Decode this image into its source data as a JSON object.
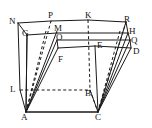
{
  "figure": {
    "type": "geometry-diagram",
    "width": 152,
    "height": 128,
    "background_color": "#ffffff",
    "stroke_color": "#1a1a1a",
    "label_color": "#111111"
  },
  "vertices": [
    {
      "id": "N",
      "label": "N",
      "x": 9,
      "y": 17,
      "point_x": 18,
      "point_y": 23
    },
    {
      "id": "P",
      "label": "P",
      "x": 48,
      "y": 11,
      "point_x": 51,
      "point_y": 21
    },
    {
      "id": "K",
      "label": "K",
      "x": 85,
      "y": 11,
      "point_x": 88,
      "point_y": 20
    },
    {
      "id": "R",
      "label": "R",
      "x": 124,
      "y": 15,
      "point_x": 126,
      "point_y": 22
    },
    {
      "id": "G",
      "label": "G",
      "x": 22,
      "y": 29,
      "point_x": 27,
      "point_y": 35
    },
    {
      "id": "M",
      "label": "M",
      "x": 54,
      "y": 24,
      "point_x": 57,
      "point_y": 31
    },
    {
      "id": "O",
      "label": "O",
      "x": 56,
      "y": 33,
      "point_x": 57,
      "point_y": 40
    },
    {
      "id": "H",
      "label": "H",
      "x": 129,
      "y": 27,
      "point_x": 128,
      "point_y": 33
    },
    {
      "id": "Q",
      "label": "Q",
      "x": 131,
      "y": 36,
      "point_x": 130,
      "point_y": 42
    },
    {
      "id": "E",
      "label": "E",
      "x": 97,
      "y": 41,
      "point_x": 95,
      "point_y": 46
    },
    {
      "id": "D",
      "label": "D",
      "x": 133,
      "y": 47,
      "point_x": 131,
      "point_y": 51
    },
    {
      "id": "F",
      "label": "F",
      "x": 58,
      "y": 55,
      "point_x": 58,
      "point_y": 52
    },
    {
      "id": "L",
      "label": "L",
      "x": 10,
      "y": 85,
      "point_x": 20,
      "point_y": 90
    },
    {
      "id": "B",
      "label": "B",
      "x": 85,
      "y": 89,
      "point_x": 90,
      "point_y": 90
    },
    {
      "id": "A",
      "label": "A",
      "x": 21,
      "y": 113,
      "point_x": 26,
      "point_y": 112
    },
    {
      "id": "C",
      "label": "C",
      "x": 95,
      "y": 113,
      "point_x": 98,
      "point_y": 112
    }
  ],
  "edges": {
    "solid": [
      "N-P",
      "P-K",
      "K-R",
      "N-G",
      "G-O",
      "O-F",
      "R-H",
      "H-Q",
      "Q-D",
      "G-M",
      "M-O",
      "E-D",
      "F-E",
      "N-A",
      "R-C",
      "A-C",
      "P-M",
      "K-E",
      "A-L",
      "A-O",
      "A-M",
      "A-G",
      "C-E",
      "C-Q",
      "C-H",
      "C-D",
      "L-A",
      "P-A",
      "K-C",
      "R-C"
    ],
    "dashed": [
      "L-B",
      "B-K",
      "B-C",
      "L-N",
      "P-A",
      "M-A",
      "O-A",
      "R-C",
      "H-C",
      "Q-C"
    ]
  },
  "notes": {
    "description": "Rectangular prism outline with internal diagonal lines from apex A to upper-left vertices and from C to upper-right vertices; hidden edges L-B-C drawn dashed."
  }
}
